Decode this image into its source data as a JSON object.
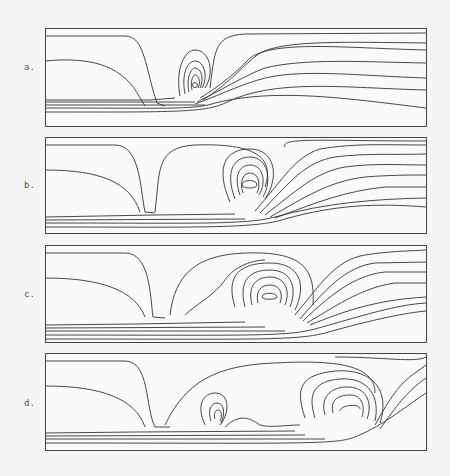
{
  "figure": {
    "panels": [
      {
        "label": "a."
      },
      {
        "label": "b."
      },
      {
        "label": "c."
      },
      {
        "label": "d."
      }
    ]
  }
}
